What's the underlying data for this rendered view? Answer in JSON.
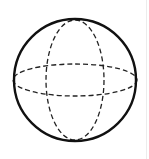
{
  "diagram": {
    "title": "Sphere",
    "colors": {
      "background": "#ffffff",
      "stroke": "#111111",
      "dashed_stroke": "#222222",
      "edge_line": "#ececec"
    },
    "outline": {
      "cx": 75,
      "cy": 80,
      "r": 61,
      "stroke_width": 2.4
    },
    "equator": {
      "cx": 75,
      "cy": 80,
      "rx": 62,
      "ry": 16,
      "dasharray": "5 3",
      "stroke_width": 1.3
    },
    "meridian": {
      "cx": 75,
      "cy": 80,
      "rx": 29,
      "ry": 60,
      "dasharray": "5 3",
      "stroke_width": 1.3
    }
  }
}
